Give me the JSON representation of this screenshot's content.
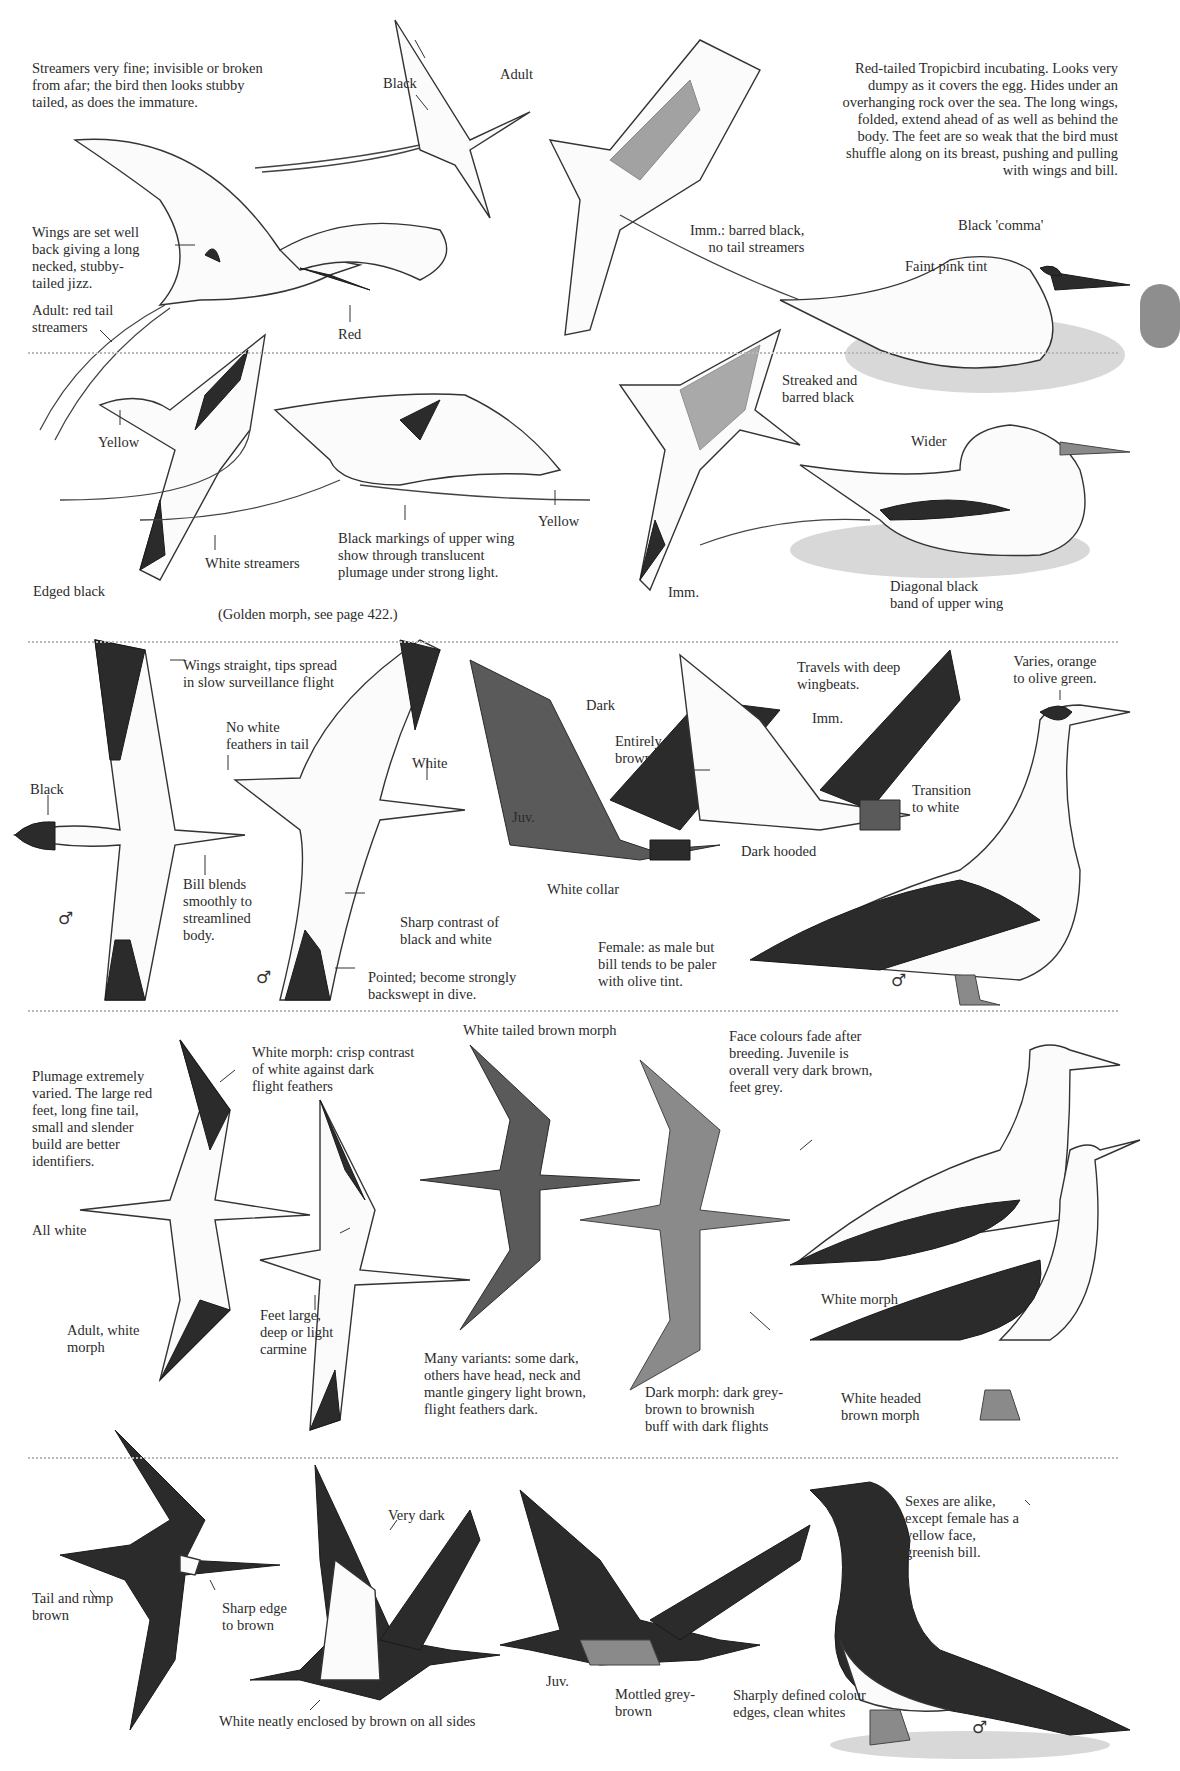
{
  "page": {
    "tab_color": "#8e8e8e",
    "separator_color": "#b9b9b9"
  },
  "tropicbirds": {
    "white_tailed_adult": {
      "note": "Streamers very fine; invisible or broken\nfrom afar; the bird then looks stubby\ntailed, as does the immature.",
      "black_label": "Black",
      "adult_label": "Adult"
    },
    "red_tailed_flight": {
      "wings_note": "Wings are set well\nback giving a long\nnecked, stubby-\ntailed jizz.",
      "streamers_label": "Adult: red tail\nstreamers",
      "bill_label": "Red"
    },
    "red_tailed_immature": {
      "label": "Imm.: barred black,\nno tail streamers"
    },
    "red_tailed_incubating": {
      "note": "Red-tailed Tropicbird incubating.  Looks very\ndumpy as it covers the egg.  Hides under an\noverhanging rock over the sea.  The long wings,\nfolded, extend ahead of as well as behind the\nbody.  The feet are so weak that the bird must\nshuffle along on its breast, pushing and pulling\nwith wings and bill.",
      "comma_label": "Black 'comma'",
      "tint_label": "Faint pink tint"
    },
    "white_tailed_flight": {
      "bill_label_left": "Yellow",
      "bill_label_right": "Yellow",
      "streamers_label": "White streamers",
      "edge_label": "Edged black",
      "markings_note": "Black markings of upper wing\nshow through translucent\nplumage under strong light.",
      "golden_note": "(Golden morph, see page 422.)"
    },
    "white_tailed_immature": {
      "streak_label": "Streaked and\nbarred black",
      "imm_label": "Imm."
    },
    "white_tailed_sitting": {
      "wider_label": "Wider",
      "band_label": "Diagonal black\nband of upper wing"
    }
  },
  "masked_booby": {
    "wings_note": "Wings straight, tips spread\nin slow surveillance flight",
    "black_label": "Black",
    "bill_note": "Bill blends\nsmoothly to\nstreamlined\nbody.",
    "sex_symbol": "♂",
    "tail_note": "No white\nfeathers in tail",
    "white_label": "White",
    "contrast_note": "Sharp contrast of\nblack and white",
    "dive_note": "Pointed; become strongly\nbackswept in dive.",
    "sex_symbol_2": "♂",
    "dark_label": "Dark",
    "juv_label": "Juv.",
    "entirely_dark": "Entirely dark\nbrowns",
    "collar_label": "White collar",
    "dark_hooded": "Dark hooded",
    "travels_note": "Travels with deep\nwingbeats.",
    "imm_label": "Imm.",
    "transition_label": "Transition\nto white",
    "bill_varies": "Varies, orange\nto olive green.",
    "female_note": "Female: as male but\nbill tends to be paler\nwith olive tint.",
    "sex_symbol_3": "♂"
  },
  "red_footed_booby": {
    "plumage_note": "Plumage extremely\nvaried.  The large red\nfeet, long fine tail,\nsmall and slender\nbuild are better\nidentifiers.",
    "white_morph_note": "White morph: crisp contrast\nof white against dark\nflight feathers",
    "all_white": "All white",
    "adult_white": "Adult, white\nmorph",
    "feet_note": "Feet large,\ndeep or light\ncarmine",
    "white_tailed_brown": "White tailed brown morph",
    "variants_note": "Many variants: some dark,\nothers have head, neck and\nmantle gingery light brown,\nflight feathers dark.",
    "dark_morph_note": "Dark morph: dark grey-\nbrown to brownish\nbuff with dark flights",
    "face_note": "Face colours fade after\nbreeding.  Juvenile is\noverall very dark brown,\nfeet grey.",
    "white_morph_label": "White morph",
    "white_headed_label": "White headed\nbrown morph"
  },
  "brown_booby": {
    "tail_note": "Tail and rump\nbrown",
    "sharp_edge": "Sharp edge\nto brown",
    "very_dark": "Very dark",
    "enclosed_note": "White neatly enclosed by brown on all sides",
    "juv_label": "Juv.",
    "mottled_label": "Mottled grey-\nbrown",
    "sharply_note": "Sharply defined colour\nedges, clean whites",
    "sexes_note": "Sexes are alike,\nexcept female has a\nyellow face,\ngreenish bill.",
    "sex_symbol": "♂"
  }
}
